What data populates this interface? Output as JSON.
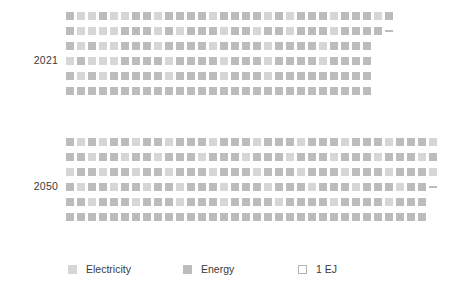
{
  "chart_data": {
    "type": "waffle",
    "title": "",
    "subtitle": "",
    "xlabel": "",
    "ylabel": "",
    "unit": "EJ",
    "unit_per_cell": 1,
    "grid": false,
    "legend_position": "bottom",
    "categories": [
      "2021",
      "2050"
    ],
    "series": [
      {
        "name": "Electricity",
        "color": "#d6d6d6"
      },
      {
        "name": "Energy",
        "color": "#bcbcbc"
      }
    ],
    "groups": [
      {
        "label": "2021",
        "rows": [
          {
            "cells": [
              "energy",
              "electricity",
              "electricity",
              "energy",
              "electricity",
              "electricity",
              "energy",
              "energy",
              "electricity",
              "energy",
              "energy",
              "energy",
              "energy",
              "electricity",
              "energy",
              "energy",
              "energy",
              "energy",
              "electricity",
              "energy",
              "electricity",
              "energy",
              "energy",
              "energy",
              "electricity",
              "energy",
              "energy",
              "energy",
              "electricity",
              "energy"
            ],
            "partial": null
          },
          {
            "cells": [
              "energy",
              "electricity",
              "electricity",
              "electricity",
              "electricity",
              "energy",
              "energy",
              "energy",
              "electricity",
              "energy",
              "electricity",
              "energy",
              "energy",
              "energy",
              "electricity",
              "energy",
              "energy",
              "electricity",
              "energy",
              "energy",
              "electricity",
              "energy",
              "energy",
              "energy",
              "electricity",
              "energy",
              "energy",
              "energy",
              "energy"
            ],
            "partial": "energy"
          },
          {
            "cells": [
              "energy",
              "electricity",
              "energy",
              "electricity",
              "electricity",
              "energy",
              "energy",
              "energy",
              "electricity",
              "energy",
              "energy",
              "energy",
              "energy",
              "electricity",
              "energy",
              "energy",
              "energy",
              "energy",
              "electricity",
              "energy",
              "energy",
              "energy",
              "energy",
              "electricity",
              "energy",
              "energy",
              "energy",
              "energy"
            ],
            "partial": null
          },
          {
            "cells": [
              "electricity",
              "energy",
              "electricity",
              "electricity",
              "electricity",
              "energy",
              "energy",
              "energy",
              "energy",
              "electricity",
              "energy",
              "energy",
              "energy",
              "energy",
              "electricity",
              "energy",
              "energy",
              "energy",
              "electricity",
              "energy",
              "energy",
              "energy",
              "energy",
              "electricity",
              "energy",
              "energy",
              "energy",
              "energy"
            ],
            "partial": null
          },
          {
            "cells": [
              "energy",
              "electricity",
              "energy",
              "electricity",
              "energy",
              "energy",
              "energy",
              "energy",
              "energy",
              "electricity",
              "energy",
              "energy",
              "energy",
              "energy",
              "electricity",
              "energy",
              "energy",
              "energy",
              "electricity",
              "energy",
              "energy",
              "energy",
              "energy",
              "energy",
              "energy",
              "energy",
              "energy",
              "energy"
            ],
            "partial": null
          },
          {
            "cells": [
              "energy",
              "energy",
              "energy",
              "energy",
              "energy",
              "energy",
              "energy",
              "energy",
              "energy",
              "energy",
              "energy",
              "energy",
              "energy",
              "energy",
              "energy",
              "energy",
              "energy",
              "energy",
              "energy",
              "energy",
              "energy",
              "energy",
              "energy",
              "energy",
              "energy",
              "energy",
              "energy",
              "energy"
            ],
            "partial": null
          }
        ]
      },
      {
        "label": "2050",
        "rows": [
          {
            "cells": [
              "energy",
              "electricity",
              "energy",
              "electricity",
              "energy",
              "energy",
              "electricity",
              "energy",
              "energy",
              "electricity",
              "energy",
              "energy",
              "energy",
              "electricity",
              "energy",
              "energy",
              "energy",
              "electricity",
              "energy",
              "energy",
              "energy",
              "electricity",
              "energy",
              "energy",
              "energy",
              "electricity",
              "energy",
              "energy",
              "energy",
              "electricity",
              "energy",
              "energy",
              "energy",
              "electricity"
            ],
            "partial": null
          },
          {
            "cells": [
              "energy",
              "energy",
              "electricity",
              "energy",
              "energy",
              "electricity",
              "energy",
              "energy",
              "electricity",
              "energy",
              "energy",
              "energy",
              "electricity",
              "energy",
              "energy",
              "energy",
              "electricity",
              "energy",
              "energy",
              "energy",
              "electricity",
              "energy",
              "energy",
              "energy",
              "electricity",
              "energy",
              "energy",
              "energy",
              "electricity",
              "energy",
              "energy",
              "energy",
              "electricity",
              "energy"
            ],
            "partial": null
          },
          {
            "cells": [
              "electricity",
              "energy",
              "energy",
              "electricity",
              "energy",
              "energy",
              "electricity",
              "energy",
              "energy",
              "electricity",
              "energy",
              "energy",
              "energy",
              "electricity",
              "energy",
              "energy",
              "energy",
              "electricity",
              "energy",
              "energy",
              "energy",
              "electricity",
              "energy",
              "energy",
              "energy",
              "electricity",
              "energy",
              "energy",
              "energy",
              "electricity",
              "energy",
              "energy",
              "energy",
              "electricity"
            ],
            "partial": null
          },
          {
            "cells": [
              "energy",
              "electricity",
              "energy",
              "energy",
              "electricity",
              "energy",
              "energy",
              "electricity",
              "energy",
              "energy",
              "electricity",
              "energy",
              "energy",
              "energy",
              "electricity",
              "energy",
              "energy",
              "energy",
              "electricity",
              "energy",
              "energy",
              "energy",
              "electricity",
              "energy",
              "energy",
              "energy",
              "electricity",
              "energy",
              "energy",
              "energy",
              "electricity",
              "energy",
              "energy"
            ],
            "partial": "energy"
          },
          {
            "cells": [
              "energy",
              "energy",
              "electricity",
              "energy",
              "energy",
              "energy",
              "electricity",
              "energy",
              "energy",
              "energy",
              "electricity",
              "energy",
              "energy",
              "energy",
              "electricity",
              "energy",
              "energy",
              "energy",
              "energy",
              "electricity",
              "energy",
              "energy",
              "energy",
              "energy",
              "electricity",
              "energy",
              "energy",
              "energy",
              "energy",
              "electricity",
              "energy",
              "energy",
              "energy"
            ],
            "partial": null
          },
          {
            "cells": [
              "energy",
              "energy",
              "energy",
              "energy",
              "energy",
              "energy",
              "energy",
              "energy",
              "energy",
              "energy",
              "energy",
              "energy",
              "energy",
              "energy",
              "energy",
              "energy",
              "energy",
              "energy",
              "energy",
              "energy",
              "energy",
              "energy",
              "energy",
              "energy",
              "energy",
              "energy",
              "energy",
              "energy",
              "energy",
              "energy",
              "energy",
              "energy",
              "energy"
            ],
            "partial": null
          }
        ]
      }
    ]
  },
  "legend": {
    "items": [
      {
        "label": "Electricity",
        "swatch": "filled-light",
        "color": "#d6d6d6"
      },
      {
        "label": "Energy",
        "swatch": "filled-dark",
        "color": "#bcbcbc"
      },
      {
        "label": "1 EJ",
        "swatch": "outline",
        "color": "#ffffff"
      }
    ]
  }
}
